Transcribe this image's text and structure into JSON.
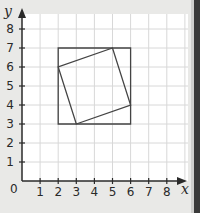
{
  "diagram": {
    "x_axis": {
      "label": "x",
      "ticks": [
        "1",
        "2",
        "3",
        "4",
        "5",
        "6",
        "7",
        "8"
      ],
      "origin_label": "0"
    },
    "y_axis": {
      "label": "y",
      "ticks": [
        "1",
        "2",
        "3",
        "4",
        "5",
        "6",
        "7",
        "8"
      ]
    },
    "outer_square": {
      "vertices": [
        [
          2,
          3
        ],
        [
          6,
          3
        ],
        [
          6,
          7
        ],
        [
          2,
          7
        ]
      ]
    },
    "inner_square": {
      "vertices": [
        [
          3,
          3
        ],
        [
          6,
          4
        ],
        [
          5,
          7
        ],
        [
          2,
          6
        ]
      ]
    },
    "colors": {
      "grid": "#d8d8d8",
      "axis": "#2a2a2a",
      "shape": "#444444",
      "background": "#ffffff"
    }
  }
}
